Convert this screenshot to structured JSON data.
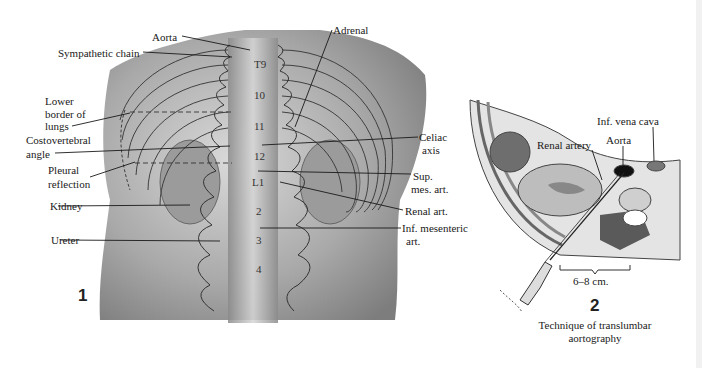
{
  "figure1": {
    "number": "1",
    "labels": {
      "aorta": "Aorta",
      "sympathetic_chain": "Sympathetic chain",
      "lower_border_1": "Lower",
      "lower_border_2": "border of",
      "lower_border_3": "lungs",
      "costovertebral_1": "Costovertebral",
      "costovertebral_2": "angle",
      "pleural_1": "Pleural",
      "pleural_2": "reflection",
      "kidney": "Kidney",
      "ureter": "Ureter",
      "adrenal": "Adrenal",
      "celiac_1": "Celiac",
      "celiac_2": "axis",
      "sup_mes_1": "Sup.",
      "sup_mes_2": "mes. art.",
      "renal_art": "Renal art.",
      "inf_mes_1": "Inf. mesenteric",
      "inf_mes_2": "art."
    },
    "vertebrae": [
      "T9",
      "10",
      "11",
      "12",
      "L1",
      "2",
      "3",
      "4"
    ]
  },
  "figure2": {
    "number": "2",
    "labels": {
      "inf_vena_cava": "Inf. vena cava",
      "aorta": "Aorta",
      "renal_artery": "Renal artery",
      "distance": "6–8 cm."
    },
    "caption_1": "Technique of translumbar",
    "caption_2": "aortography"
  }
}
